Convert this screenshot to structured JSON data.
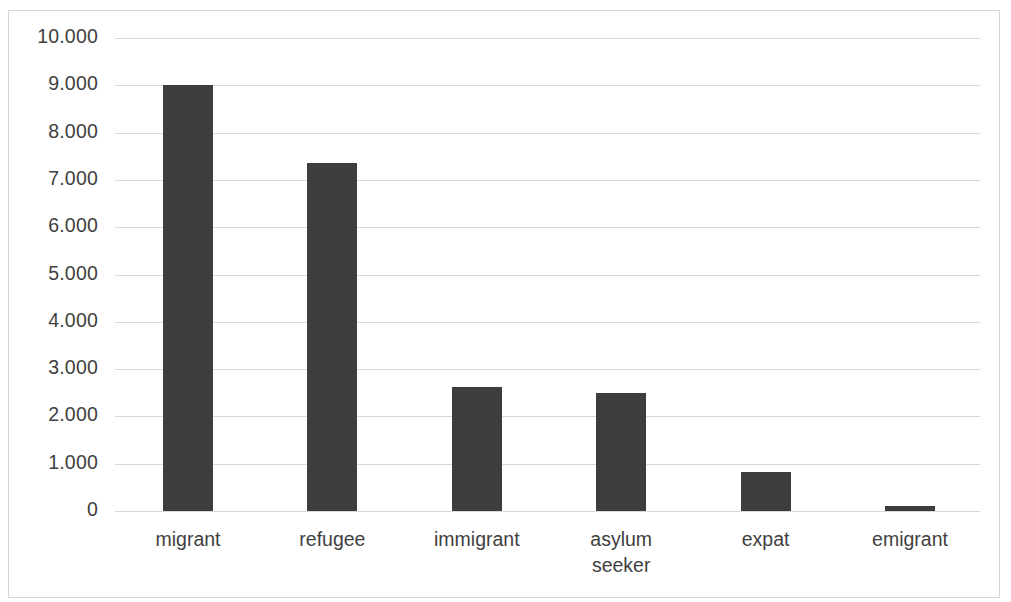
{
  "chart_data": {
    "type": "bar",
    "title": "",
    "subtitle": "",
    "xlabel": "",
    "ylabel": "",
    "categories": [
      "migrant",
      "refugee",
      "immigrant",
      "asylum seeker",
      "expat",
      "emigrant"
    ],
    "values": [
      9000,
      7350,
      2620,
      2500,
      820,
      100
    ],
    "series": [
      {
        "name": "",
        "values": [
          9000,
          7350,
          2620,
          2500,
          820,
          100
        ]
      }
    ],
    "ylim": [
      0,
      10000
    ],
    "y_ticks": [
      0,
      1000,
      2000,
      3000,
      4000,
      5000,
      6000,
      7000,
      8000,
      9000,
      10000
    ],
    "y_tick_labels": [
      "0",
      "1.000",
      "2.000",
      "3.000",
      "4.000",
      "5.000",
      "6.000",
      "7.000",
      "8.000",
      "9.000",
      "10.000"
    ],
    "x_tick_labels": [
      "migrant",
      "refugee",
      "immigrant",
      "asylum\nseeker",
      "expat",
      "emigrant"
    ],
    "grid": true,
    "grid_axis": "y",
    "legend": false,
    "legend_position": "none",
    "bar_color": "#3d3d3d",
    "gridline_color": "#d9d9d9",
    "axis_text_color": "#3f3f3f",
    "background_color": "#ffffff",
    "border_color": "#d6d6d6",
    "annotations": []
  }
}
